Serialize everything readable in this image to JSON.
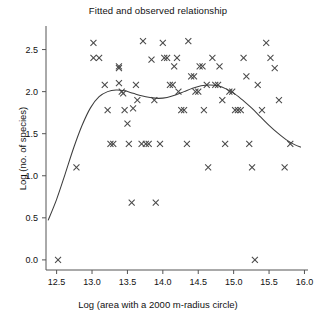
{
  "chart_data": {
    "type": "scatter",
    "title": "Fitted and observed relationship",
    "xlabel": "Log (area with a 2000 m-radius circle)",
    "ylabel": "Log (no. of species)",
    "xlim": [
      12.35,
      16.05
    ],
    "ylim": [
      -0.12,
      2.78
    ],
    "xticks": [
      12.5,
      13.0,
      13.5,
      14.0,
      14.5,
      15.0,
      15.5,
      16.0
    ],
    "xticklabels": [
      "12.5",
      "13.0",
      "13.5",
      "14.0",
      "14.5",
      "15.0",
      "15.5",
      "16.0"
    ],
    "yticks": [
      0.0,
      0.5,
      1.0,
      1.5,
      2.0,
      2.5
    ],
    "yticklabels": [
      "0.0",
      "0.5",
      "1.0",
      "1.5",
      "2.0",
      "2.5"
    ],
    "grid": false,
    "legend": null,
    "marker": "x",
    "marker_color": "#4a4a4a",
    "curve_color": "#3d3d3d",
    "points": [
      [
        12.52,
        0.0
      ],
      [
        12.78,
        1.1
      ],
      [
        13.02,
        2.58
      ],
      [
        13.02,
        2.4
      ],
      [
        13.1,
        2.4
      ],
      [
        13.18,
        2.08
      ],
      [
        13.22,
        1.78
      ],
      [
        13.26,
        1.38
      ],
      [
        13.3,
        1.38
      ],
      [
        13.38,
        2.28
      ],
      [
        13.38,
        2.3
      ],
      [
        13.38,
        2.1
      ],
      [
        13.42,
        2.0
      ],
      [
        13.44,
        1.98
      ],
      [
        13.46,
        1.78
      ],
      [
        13.5,
        1.62
      ],
      [
        13.52,
        1.38
      ],
      [
        13.56,
        0.68
      ],
      [
        13.58,
        1.8
      ],
      [
        13.62,
        2.08
      ],
      [
        13.64,
        1.9
      ],
      [
        13.7,
        1.38
      ],
      [
        13.72,
        2.6
      ],
      [
        13.76,
        1.38
      ],
      [
        13.8,
        1.38
      ],
      [
        13.84,
        2.38
      ],
      [
        13.88,
        1.9
      ],
      [
        13.9,
        0.68
      ],
      [
        13.96,
        1.38
      ],
      [
        14.0,
        2.58
      ],
      [
        14.02,
        2.4
      ],
      [
        14.06,
        2.4
      ],
      [
        14.1,
        2.08
      ],
      [
        14.14,
        2.08
      ],
      [
        14.16,
        2.3
      ],
      [
        14.2,
        2.4
      ],
      [
        14.22,
        2.0
      ],
      [
        14.26,
        1.78
      ],
      [
        14.3,
        1.78
      ],
      [
        14.34,
        1.38
      ],
      [
        14.36,
        2.6
      ],
      [
        14.4,
        2.18
      ],
      [
        14.44,
        2.18
      ],
      [
        14.46,
        2.0
      ],
      [
        14.5,
        2.0
      ],
      [
        14.52,
        2.3
      ],
      [
        14.56,
        2.3
      ],
      [
        14.58,
        1.78
      ],
      [
        14.62,
        2.08
      ],
      [
        14.64,
        1.1
      ],
      [
        14.7,
        2.4
      ],
      [
        14.74,
        2.08
      ],
      [
        14.78,
        2.08
      ],
      [
        14.8,
        2.3
      ],
      [
        14.84,
        1.9
      ],
      [
        14.88,
        1.38
      ],
      [
        14.94,
        2.0
      ],
      [
        14.98,
        2.0
      ],
      [
        15.02,
        1.78
      ],
      [
        15.06,
        1.78
      ],
      [
        15.1,
        1.78
      ],
      [
        15.14,
        2.4
      ],
      [
        15.18,
        2.18
      ],
      [
        15.22,
        1.38
      ],
      [
        15.26,
        1.1
      ],
      [
        15.3,
        0.0
      ],
      [
        15.34,
        2.08
      ],
      [
        15.4,
        1.78
      ],
      [
        15.46,
        2.58
      ],
      [
        15.52,
        2.4
      ],
      [
        15.58,
        2.28
      ],
      [
        15.64,
        1.9
      ],
      [
        15.72,
        1.1
      ],
      [
        15.8,
        1.38
      ]
    ],
    "fit_curve": [
      [
        12.38,
        0.47
      ],
      [
        12.5,
        0.72
      ],
      [
        12.62,
        1.02
      ],
      [
        12.74,
        1.33
      ],
      [
        12.86,
        1.6
      ],
      [
        12.98,
        1.81
      ],
      [
        13.1,
        1.94
      ],
      [
        13.22,
        2.0
      ],
      [
        13.34,
        2.02
      ],
      [
        13.46,
        2.01
      ],
      [
        13.58,
        1.98
      ],
      [
        13.7,
        1.95
      ],
      [
        13.82,
        1.93
      ],
      [
        13.94,
        1.92
      ],
      [
        14.06,
        1.93
      ],
      [
        14.18,
        1.96
      ],
      [
        14.3,
        2.0
      ],
      [
        14.42,
        2.04
      ],
      [
        14.54,
        2.07
      ],
      [
        14.66,
        2.08
      ],
      [
        14.78,
        2.07
      ],
      [
        14.9,
        2.03
      ],
      [
        15.02,
        1.97
      ],
      [
        15.14,
        1.89
      ],
      [
        15.26,
        1.8
      ],
      [
        15.38,
        1.7
      ],
      [
        15.5,
        1.6
      ],
      [
        15.62,
        1.51
      ],
      [
        15.74,
        1.43
      ],
      [
        15.86,
        1.37
      ],
      [
        15.95,
        1.34
      ]
    ]
  }
}
